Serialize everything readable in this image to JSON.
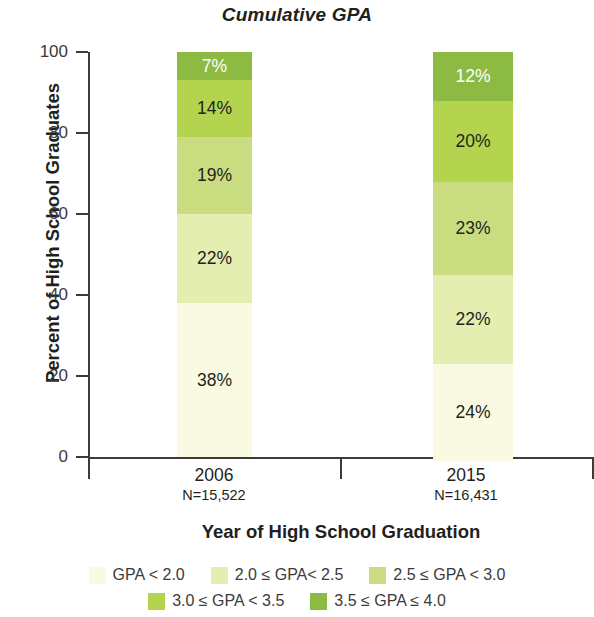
{
  "chart_data": {
    "type": "bar",
    "subtype": "stacked-bar-100",
    "title": "Cumulative GPA",
    "xlabel": "Year of High School Graduation",
    "ylabel": "Percent of High School Graduates",
    "ylim": [
      0,
      100
    ],
    "yticks": [
      0,
      20,
      40,
      60,
      80,
      100
    ],
    "ytick_labels": [
      "0",
      "20",
      "40",
      "60",
      "80",
      "100"
    ],
    "grid": false,
    "legend_position": "bottom",
    "categories": [
      "2006",
      "2015"
    ],
    "category_sublabels": [
      "N=15,522",
      "N=16,431"
    ],
    "series": [
      {
        "name": "GPA < 2.0",
        "color": "#FAFAE2",
        "values": [
          38,
          24
        ],
        "labels": [
          "38%",
          "24%"
        ],
        "label_color": "dark"
      },
      {
        "name": "2.0 ≤ GPA< 2.5",
        "color": "#E3EEB0",
        "values": [
          22,
          22
        ],
        "labels": [
          "22%",
          "22%"
        ],
        "label_color": "dark"
      },
      {
        "name": "2.5 ≤ GPA < 3.0",
        "color": "#C9DD80",
        "values": [
          19,
          23
        ],
        "labels": [
          "19%",
          "23%"
        ],
        "label_color": "dark"
      },
      {
        "name": "3.0 ≤ GPA < 3.5",
        "color": "#B4D44F",
        "values": [
          14,
          20
        ],
        "labels": [
          "14%",
          "20%"
        ],
        "label_color": "dark"
      },
      {
        "name": "3.5 ≤ GPA ≤ 4.0",
        "color": "#8CBA43",
        "values": [
          7,
          12
        ],
        "labels": [
          "7%",
          "12%"
        ],
        "label_color": "light"
      }
    ]
  },
  "axis": {
    "ticks": [
      {
        "value": "100"
      },
      {
        "value": "80"
      },
      {
        "value": "60"
      },
      {
        "value": "40"
      },
      {
        "value": "20"
      },
      {
        "value": "0"
      }
    ]
  },
  "legend": {
    "row1": [
      {
        "label": "GPA < 2.0",
        "color": "#FAFAE2"
      },
      {
        "label": "2.0 ≤ GPA< 2.5",
        "color": "#E3EEB0"
      },
      {
        "label": "2.5 ≤ GPA < 3.0",
        "color": "#C9DD80"
      }
    ],
    "row2": [
      {
        "label": "3.0 ≤ GPA < 3.5",
        "color": "#B4D44F"
      },
      {
        "label": "3.5 ≤ GPA ≤ 4.0",
        "color": "#8CBA43"
      }
    ]
  }
}
